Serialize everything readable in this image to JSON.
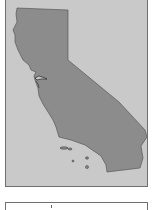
{
  "map": {
    "region": "California",
    "colors": {
      "background": "#c9c9c9",
      "land": "#8c8c8c",
      "border": "#6f6f6f",
      "outline": "#4a4a4a"
    }
  },
  "legend": {
    "visible_tick": true
  }
}
